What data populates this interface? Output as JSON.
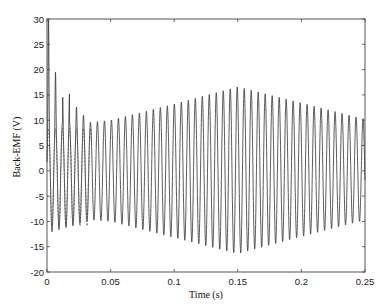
{
  "chart_data": {
    "type": "line",
    "title": "",
    "xlabel": "Time (s)",
    "ylabel": "Back-EMF (V)",
    "xlim": [
      0,
      0.25
    ],
    "ylim": [
      -20,
      30
    ],
    "xticks": [
      0,
      0.05,
      0.1,
      0.15,
      0.2,
      0.25
    ],
    "xtick_labels": [
      "0",
      "0.05",
      "0.1",
      "0.15",
      "0.2",
      "0.25"
    ],
    "yticks": [
      -20,
      -15,
      -10,
      -5,
      0,
      5,
      10,
      15,
      20,
      25,
      30
    ],
    "ytick_labels": [
      "-20",
      "-15",
      "-10",
      "-5",
      "0",
      "5",
      "10",
      "15",
      "20",
      "25",
      "30"
    ],
    "grid": false,
    "legend": null,
    "line_color": "#333333",
    "series": [
      {
        "name": "Back-EMF",
        "waveform": "sinusoidal",
        "frequency_hz": 182,
        "startup_transient_peaks": [
          {
            "t": 0.0012,
            "v": 30
          },
          {
            "t": 0.0085,
            "v": 19.5
          },
          {
            "t": 0.015,
            "v": 15.2
          },
          {
            "t": 0.0218,
            "v": 12.6
          },
          {
            "t": 0.0285,
            "v": 11.0
          }
        ],
        "positive_envelope": [
          {
            "t": 0.0,
            "v": 9.5
          },
          {
            "t": 0.035,
            "v": 9.6
          },
          {
            "t": 0.05,
            "v": 10.0
          },
          {
            "t": 0.1,
            "v": 13.2
          },
          {
            "t": 0.15,
            "v": 16.6
          },
          {
            "t": 0.2,
            "v": 13.4
          },
          {
            "t": 0.25,
            "v": 10.2
          }
        ],
        "negative_envelope": [
          {
            "t": 0.0,
            "v": -12.3
          },
          {
            "t": 0.01,
            "v": -11.6
          },
          {
            "t": 0.035,
            "v": -9.7
          },
          {
            "t": 0.05,
            "v": -10.0
          },
          {
            "t": 0.1,
            "v": -13.2
          },
          {
            "t": 0.15,
            "v": -16.4
          },
          {
            "t": 0.2,
            "v": -13.0
          },
          {
            "t": 0.25,
            "v": -9.7
          }
        ]
      }
    ]
  }
}
